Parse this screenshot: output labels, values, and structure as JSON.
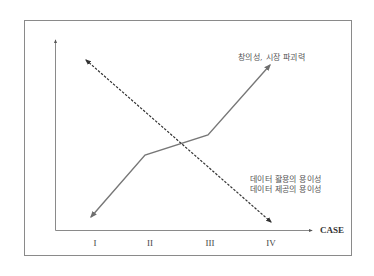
{
  "diagram": {
    "x_axis": {
      "label": "CASE",
      "ticks": [
        {
          "label": "I",
          "x": 95
        },
        {
          "label": "II",
          "x": 150
        },
        {
          "label": "III",
          "x": 210
        },
        {
          "label": "IV",
          "x": 271
        }
      ]
    },
    "series": [
      {
        "name": "창의성, 시장 파괴력",
        "style": "solid",
        "trend": "increasing",
        "color": "#777777"
      },
      {
        "name_lines": [
          "데이터 활용의 용이성",
          "데이터 제공의 용이성"
        ],
        "style": "dashed",
        "trend": "decreasing",
        "color": "#444444"
      }
    ],
    "labels": {
      "top": "창의성, 시장 파괴력",
      "bottom_line1": "데이터 활용의 용이성",
      "bottom_line2": "데이터 제공의 용이성"
    }
  }
}
